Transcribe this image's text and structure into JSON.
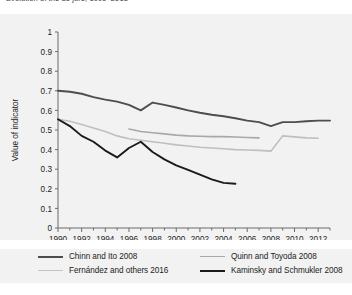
{
  "title": "Evolution of the de jure, 1990–2013",
  "chart_data": {
    "type": "line",
    "title": "Evolution of the de jure, 1990–2013",
    "xlabel": "",
    "ylabel": "Value of indicator",
    "xlim": [
      1990,
      2013
    ],
    "ylim": [
      0,
      1
    ],
    "xticks": [
      1990,
      1992,
      1994,
      1996,
      1998,
      2000,
      2002,
      2004,
      2006,
      2008,
      2010,
      2012
    ],
    "xtick_labels": [
      "1990",
      "1992",
      "1994",
      "1996",
      "1998",
      "2000",
      "2002",
      "2004",
      "2006",
      "2008",
      "2010",
      "2012"
    ],
    "xminor_step": 1,
    "yticks": [
      0,
      0.1,
      0.2,
      0.3,
      0.4,
      0.5,
      0.6,
      0.7,
      0.8,
      0.9,
      1
    ],
    "ytick_labels": [
      "0",
      "0.1",
      "0.2",
      "0.3",
      "0.4",
      "0.5",
      "0.6",
      "0.7",
      "0.8",
      "0.9",
      "1"
    ],
    "grid": false,
    "legend_position": "below",
    "plot_background": "#f2f2f2",
    "series": [
      {
        "name": "Chinn and Ito 2008",
        "color": "#4d4d4d",
        "width": 1.9,
        "x": [
          1990,
          1991,
          1992,
          1993,
          1994,
          1995,
          1996,
          1997,
          1998,
          1999,
          2000,
          2001,
          2002,
          2003,
          2004,
          2005,
          2006,
          2007,
          2008,
          2009,
          2010,
          2011,
          2012,
          2013
        ],
        "y": [
          0.7,
          0.695,
          0.685,
          0.668,
          0.655,
          0.645,
          0.628,
          0.6,
          0.64,
          0.628,
          0.615,
          0.6,
          0.588,
          0.578,
          0.57,
          0.56,
          0.548,
          0.54,
          0.52,
          0.54,
          0.54,
          0.545,
          0.548,
          0.548
        ]
      },
      {
        "name": "Quinn and Toyoda 2008",
        "color": "#a8a8a8",
        "width": 1.6,
        "x": [
          1996,
          1997,
          1998,
          1999,
          2000,
          2001,
          2002,
          2003,
          2004,
          2005,
          2006,
          2007
        ],
        "y": [
          0.505,
          0.492,
          0.486,
          0.48,
          0.474,
          0.47,
          0.468,
          0.466,
          0.466,
          0.464,
          0.462,
          0.46
        ]
      },
      {
        "name": "Fernández and others 2016",
        "color": "#bfbfbf",
        "width": 1.6,
        "x": [
          1990,
          1991,
          1992,
          1993,
          1994,
          1995,
          1996,
          1997,
          1998,
          1999,
          2000,
          2001,
          2002,
          2003,
          2004,
          2005,
          2006,
          2007,
          2008,
          2009,
          2010,
          2011,
          2012
        ],
        "y": [
          0.555,
          0.545,
          0.528,
          0.51,
          0.492,
          0.47,
          0.455,
          0.448,
          0.44,
          0.432,
          0.424,
          0.418,
          0.412,
          0.408,
          0.404,
          0.4,
          0.398,
          0.396,
          0.392,
          0.47,
          0.465,
          0.46,
          0.458
        ]
      },
      {
        "name": "Kaminsky and Schmukler 2008",
        "color": "#1a1a1a",
        "width": 1.9,
        "x": [
          1990,
          1991,
          1992,
          1993,
          1994,
          1995,
          1996,
          1997,
          1998,
          1999,
          2000,
          2001,
          2002,
          2003,
          2004,
          2005
        ],
        "y": [
          0.555,
          0.52,
          0.47,
          0.44,
          0.395,
          0.36,
          0.408,
          0.44,
          0.388,
          0.35,
          0.32,
          0.296,
          0.272,
          0.248,
          0.23,
          0.226
        ]
      }
    ]
  },
  "legend": {
    "items": [
      {
        "label": "Chinn and Ito 2008",
        "color": "#4d4d4d",
        "width": 2.2
      },
      {
        "label": "Quinn and Toyoda 2008",
        "color": "#a8a8a8",
        "width": 1.8
      },
      {
        "label": "Fernández and others 2016",
        "color": "#c4c4c4",
        "width": 1.8
      },
      {
        "label": "Kaminsky and Schmukler 2008",
        "color": "#1a1a1a",
        "width": 2.4
      }
    ]
  }
}
